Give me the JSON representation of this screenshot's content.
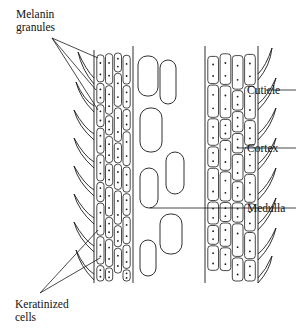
{
  "labels": {
    "melanin_line1": "Melanin",
    "melanin_line2": "granules",
    "cuticle": "Cuticle",
    "cortex": "Cortex",
    "medulla": "Medulla",
    "keratinized_line1": "Keratinized",
    "keratinized_line2": "cells"
  },
  "colors": {
    "ink": "#1a1a1a",
    "background": "#ffffff"
  }
}
